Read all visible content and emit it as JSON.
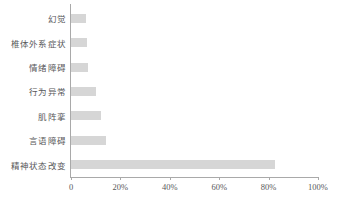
{
  "chart_data": {
    "type": "bar",
    "orientation": "horizontal",
    "title": "",
    "xlabel": "",
    "ylabel": "",
    "categories": [
      "幻觉",
      "椎体外系症状",
      "情绪障碍",
      "行为异常",
      "肌阵挛",
      "言语障碍",
      "精神状态改变"
    ],
    "values": [
      6,
      6.5,
      7,
      10,
      12,
      14,
      82.5
    ],
    "value_suffix": "%",
    "xlim": [
      0,
      100
    ],
    "xticks": [
      0,
      20,
      40,
      60,
      80,
      100
    ],
    "xtick_labels": [
      "0",
      "20%",
      "40%",
      "60%",
      "80%",
      "100%"
    ],
    "grid": false,
    "legend": null,
    "bar_color": "#d6d6d6",
    "axis_color": "#a9a9a9",
    "text_color": "#58585a"
  }
}
